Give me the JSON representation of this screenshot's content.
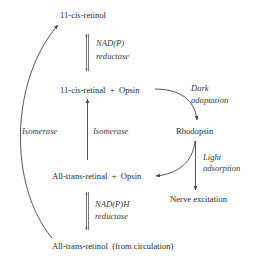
{
  "diagram": {
    "nodes": {
      "cis_retinol": "11-cis-retinol",
      "cis_retinal_opsin": "11-cis-retinal  +  Opsin",
      "rhodopsin": "Rhodopsin",
      "trans_retinal_opsin": "All-trans-retinal  +  Opsin",
      "nerve_excitation": "Nerve excitation",
      "trans_retinol": "All-trans-retinol  (from circulation)"
    },
    "edges": {
      "nadp_reductase": {
        "line1": "NAD(P)",
        "line2": "reductase"
      },
      "nadph_reductase": {
        "line1": "NAD(P)H",
        "line2": "reductase"
      },
      "dark_adaptation": {
        "line1": "Dark",
        "line2": "adaptation"
      },
      "light_adsorption": {
        "line1": "Light",
        "line2": "adsorption"
      },
      "isomerase_left": "Isomerase",
      "isomerase_middle": "Isomerase"
    },
    "colors": {
      "text": "#2a2a2a",
      "line": "#444444"
    }
  }
}
